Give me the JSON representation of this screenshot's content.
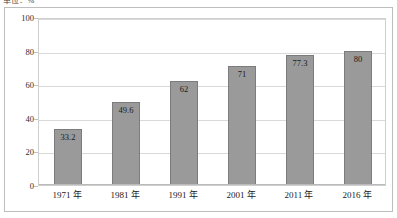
{
  "chart_data": {
    "type": "bar",
    "title": "",
    "unit_label": "单位：%",
    "categories": [
      "1971 年",
      "1981 年",
      "1991 年",
      "2001 年",
      "2011 年",
      "2016 年"
    ],
    "values": [
      33.2,
      49.6,
      62,
      71,
      77.3,
      80
    ],
    "value_labels": [
      "33.2",
      "49.6",
      "62",
      "71",
      "77.3",
      "80"
    ],
    "xlabel": "",
    "ylabel": "",
    "ylim": [
      0,
      100
    ],
    "yticks": [
      0,
      20,
      40,
      60,
      80,
      100
    ],
    "ytick_labels": [
      "0",
      "20",
      "40",
      "60",
      "80",
      "100"
    ],
    "grid": true,
    "legend": false,
    "series_color": "#9a9a9a",
    "bar_border_color": "#7c7c7c",
    "gridline_color": "#d9d9d9",
    "frame_color": "#bdbdbd"
  }
}
